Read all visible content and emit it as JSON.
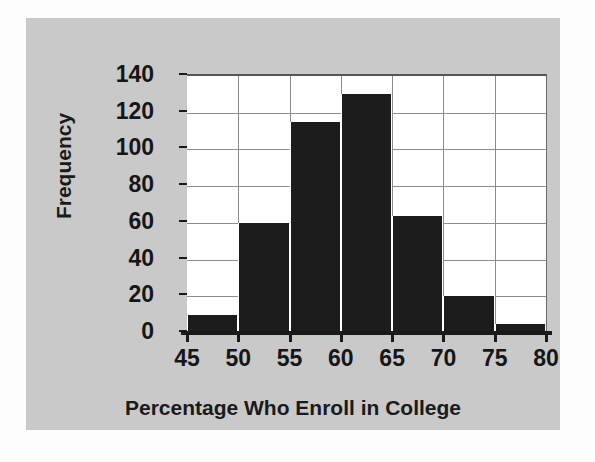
{
  "figure": {
    "background_color": "#c9c9c9",
    "canvas_color": "#fdfdfd",
    "plot_background_color": "#ffffff",
    "bar_color": "#1c1c1c",
    "gridline_color": "#8d8d8d",
    "axis_color": "#1a1a1a"
  },
  "chart_data": {
    "type": "bar",
    "title": "",
    "subtitle": "",
    "xlabel": "Percentage Who Enroll in College",
    "ylabel": "Frequency",
    "categories": [
      "45-50",
      "50-55",
      "55-60",
      "60-65",
      "65-70",
      "70-75",
      "75-80"
    ],
    "bin_edges": [
      45,
      50,
      55,
      60,
      65,
      70,
      75,
      80
    ],
    "values": [
      10,
      60,
      115,
      130,
      64,
      20,
      5
    ],
    "xlim": [
      45,
      80
    ],
    "ylim": [
      0,
      140
    ],
    "x_ticks": [
      45,
      50,
      55,
      60,
      65,
      70,
      75,
      80
    ],
    "x_tick_labels": [
      "45",
      "50",
      "55",
      "60",
      "65",
      "70",
      "75",
      "80"
    ],
    "y_ticks": [
      0,
      20,
      40,
      60,
      80,
      100,
      120,
      140
    ],
    "y_tick_labels": [
      "0",
      "20",
      "40",
      "60",
      "80",
      "100",
      "120",
      "140"
    ],
    "grid": true,
    "grid_axis": "both",
    "legend": false,
    "legend_position": "none",
    "annotations": []
  }
}
